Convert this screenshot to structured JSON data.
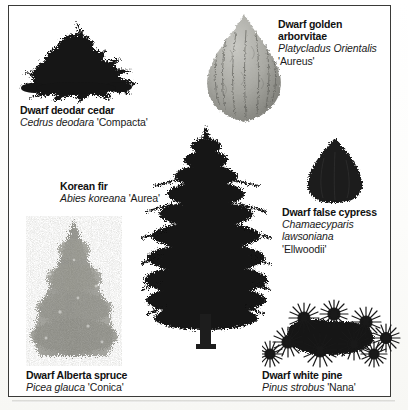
{
  "figure": {
    "type": "botanical-illustration-plate",
    "specimen_count": 6,
    "background_color": "#ffffff",
    "frame_color": "#3a3a38",
    "dark_ink": "#1a1a1a",
    "mid_gray": "#8c8c8c",
    "light_gray": "#b8b8b4"
  },
  "specimens": [
    {
      "id": "dwarf-deodar-cedar",
      "common_name": "Dwarf deodar cedar",
      "genus_species": "Cedrus deodara",
      "cultivar": "'Compacta'",
      "form": "broad spreading mound",
      "tone": "dark"
    },
    {
      "id": "dwarf-golden-arborvitae",
      "common_name_line1": "Dwarf golden",
      "common_name_line2": "arborvitae",
      "genus_species": "Platycladus Orientalis",
      "cultivar": "'Aureus'",
      "form": "teardrop / egg-shaped",
      "tone": "light"
    },
    {
      "id": "korean-fir",
      "common_name": "Korean fir",
      "genus_species": "Abies koreana",
      "cultivar": "'Aurea'",
      "form": "tall layered conical tree",
      "tone": "dark"
    },
    {
      "id": "dwarf-false-cypress",
      "common_name": "Dwarf false cypress",
      "genus_species_line1": "Chamaecyparis",
      "genus_species_line2": "lawsoniana",
      "cultivar": "'Ellwoodii'",
      "form": "narrow rounded teardrop",
      "tone": "dark"
    },
    {
      "id": "dwarf-alberta-spruce",
      "common_name": "Dwarf Alberta spruce",
      "genus_species": "Picea glauca",
      "cultivar": "'Conica'",
      "form": "dense narrow cone",
      "tone": "mid"
    },
    {
      "id": "dwarf-white-pine",
      "common_name": "Dwarf white pine",
      "genus_species": "Pinus strobus",
      "cultivar": "'Nana'",
      "form": "low spreading spiky mound",
      "tone": "dark"
    }
  ]
}
